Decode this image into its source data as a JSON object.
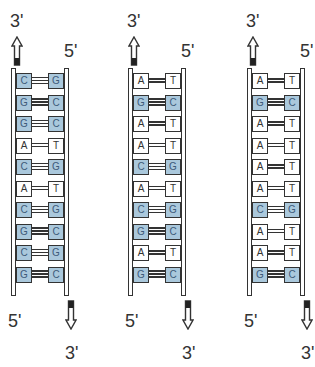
{
  "diagram": {
    "title": "",
    "colors": {
      "gc_fill": "#aac8dc",
      "at_fill": "#ffffff",
      "outline": "#333333"
    },
    "strands": [
      {
        "top_left_label": "3'",
        "top_right_label": "5'",
        "bottom_left_label": "5'",
        "bottom_right_label": "3'",
        "pairs": [
          {
            "left": "C",
            "right": "G"
          },
          {
            "left": "G",
            "right": "C"
          },
          {
            "left": "G",
            "right": "C"
          },
          {
            "left": "A",
            "right": "T"
          },
          {
            "left": "C",
            "right": "G"
          },
          {
            "left": "A",
            "right": "T"
          },
          {
            "left": "C",
            "right": "G"
          },
          {
            "left": "G",
            "right": "C"
          },
          {
            "left": "C",
            "right": "G"
          },
          {
            "left": "G",
            "right": "C"
          }
        ]
      },
      {
        "top_left_label": "3'",
        "top_right_label": "5'",
        "bottom_left_label": "5'",
        "bottom_right_label": "3'",
        "pairs": [
          {
            "left": "A",
            "right": "T"
          },
          {
            "left": "G",
            "right": "C"
          },
          {
            "left": "A",
            "right": "T"
          },
          {
            "left": "A",
            "right": "T"
          },
          {
            "left": "C",
            "right": "G"
          },
          {
            "left": "A",
            "right": "T"
          },
          {
            "left": "C",
            "right": "G"
          },
          {
            "left": "G",
            "right": "C"
          },
          {
            "left": "A",
            "right": "T"
          },
          {
            "left": "G",
            "right": "C"
          }
        ]
      },
      {
        "top_left_label": "3'",
        "top_right_label": "5'",
        "bottom_left_label": "5'",
        "bottom_right_label": "3'",
        "pairs": [
          {
            "left": "A",
            "right": "T"
          },
          {
            "left": "G",
            "right": "C"
          },
          {
            "left": "A",
            "right": "T"
          },
          {
            "left": "A",
            "right": "T"
          },
          {
            "left": "A",
            "right": "T"
          },
          {
            "left": "A",
            "right": "T"
          },
          {
            "left": "C",
            "right": "G"
          },
          {
            "left": "A",
            "right": "T"
          },
          {
            "left": "A",
            "right": "T"
          },
          {
            "left": "G",
            "right": "C"
          }
        ]
      }
    ]
  }
}
